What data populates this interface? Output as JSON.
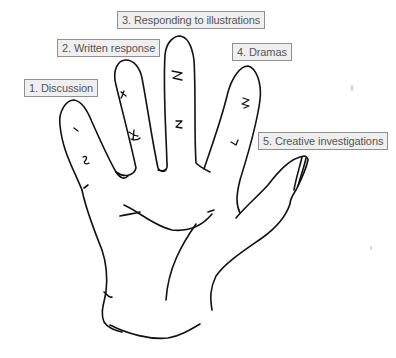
{
  "diagram": {
    "type": "hand-drawn hand with labeled fingers",
    "labels": [
      {
        "finger": "little",
        "text": "1. Discussion"
      },
      {
        "finger": "ring",
        "text": "2. Written response"
      },
      {
        "finger": "middle",
        "text": "3. Responding to illustrations"
      },
      {
        "finger": "index",
        "text": "4. Dramas"
      },
      {
        "finger": "thumb",
        "text": "5. Creative investigations"
      }
    ],
    "colors": {
      "label_background": "#efefef",
      "label_border": "#8f8f8f",
      "label_text": "#555555",
      "line": "#111111",
      "background": "#ffffff"
    }
  }
}
